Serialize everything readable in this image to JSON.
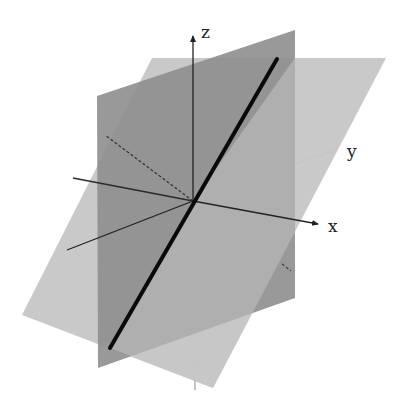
{
  "figure": {
    "axes": {
      "x_label": "x",
      "y_label": "y",
      "z_label": "z"
    },
    "colors": {
      "background": "#ffffff",
      "dark_plane": "#8f8f8f",
      "light_plane": "#c4c4c4",
      "intersection_line": "#0a0a0a",
      "axis": "#222222"
    },
    "elements": [
      {
        "name": "plane-1",
        "description": "dark vertical plane"
      },
      {
        "name": "plane-2",
        "description": "light slanted plane"
      },
      {
        "name": "intersection-line",
        "description": "thick black line where the planes intersect"
      }
    ]
  }
}
